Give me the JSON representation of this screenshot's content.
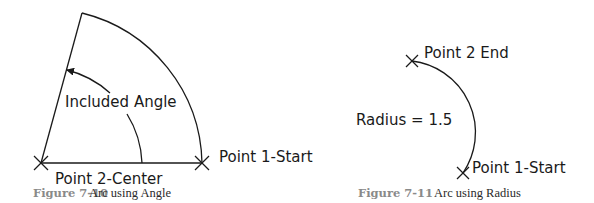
{
  "figure_left": {
    "caption_number": "Figure 7-10",
    "caption_title": "Arc using Angle",
    "labels": {
      "included_angle": "Included Angle",
      "center": "Point 2-Center",
      "start": "Point 1-Start"
    }
  },
  "figure_right": {
    "caption_number": "Figure 7-11",
    "caption_title": "Arc using Radius",
    "labels": {
      "end": "Point 2 End",
      "radius": "Radius = 1.5",
      "start": "Point 1-Start"
    }
  }
}
